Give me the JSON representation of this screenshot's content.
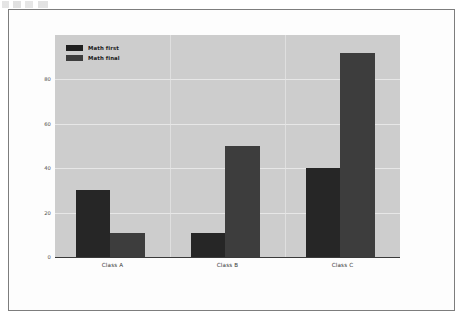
{
  "figure": {
    "background_color": "#fdfdfd",
    "plot_background_color": "#cdcdcd",
    "frame_border_color": "#7d7d7d"
  },
  "legend": {
    "position": "upper-left",
    "entries": [
      {
        "label": "Math first",
        "color": "#1f1f1f",
        "swatch_name": "legend-swatch-math-first"
      },
      {
        "label": "Math final",
        "color": "#3d3d3d",
        "swatch_name": "legend-swatch-math-final"
      }
    ]
  },
  "axes": {
    "y_ticks": [
      "0",
      "20",
      "40",
      "60",
      "80"
    ],
    "x_ticks": [
      "Class A",
      "Class B",
      "Class C"
    ]
  },
  "chart_data": {
    "type": "bar",
    "title": "",
    "xlabel": "",
    "ylabel": "",
    "categories": [
      "Class A",
      "Class B",
      "Class C"
    ],
    "series": [
      {
        "name": "Math first",
        "color": "#262626",
        "values": [
          30,
          11,
          40
        ]
      },
      {
        "name": "Math final",
        "color": "#3d3d3d",
        "values": [
          11,
          50,
          92
        ]
      }
    ],
    "ylim": [
      0,
      100
    ],
    "yticks": [
      0,
      20,
      40,
      60,
      80
    ],
    "grid": true,
    "grid_color": "#eaeaea",
    "legend_position": "upper left"
  }
}
